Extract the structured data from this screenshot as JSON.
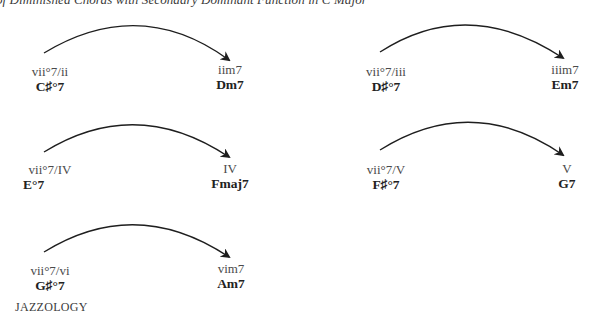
{
  "title": {
    "text": "n of Diminished Chords with Secondary Dominant Function in C Major"
  },
  "pairs": [
    {
      "source": {
        "roman": "vii°7/ii",
        "chord": "C♯°7"
      },
      "target": {
        "roman": "iim7",
        "chord": "Dm7"
      }
    },
    {
      "source": {
        "roman": "vii°7/iii",
        "chord": "D♯°7"
      },
      "target": {
        "roman": "iiim7",
        "chord": "Em7"
      }
    },
    {
      "source": {
        "roman": "vii°7/IV",
        "chord": "E°7"
      },
      "target": {
        "roman": "IV",
        "chord": "Fmaj7"
      }
    },
    {
      "source": {
        "roman": "vii°7/V",
        "chord": "F♯°7"
      },
      "target": {
        "roman": "V",
        "chord": "G7"
      }
    },
    {
      "source": {
        "roman": "vii°7/vi",
        "chord": "G♯°7"
      },
      "target": {
        "roman": "vim7",
        "chord": "Am7"
      }
    }
  ],
  "footer": {
    "text": "JAZZOLOGY"
  },
  "colors": {
    "arrow": "#1e1e1e",
    "text": "#2a2a2a"
  }
}
